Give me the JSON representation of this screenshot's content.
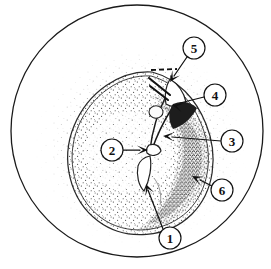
{
  "figure": {
    "kind": "stippled anatomical line drawing",
    "field_shape": "circle",
    "background_color": "#ffffff",
    "ink_color": "#111111",
    "labels": [
      {
        "id": "label-1",
        "text": "1",
        "circle": {
          "cx": 170,
          "cy": 238,
          "r": 11
        },
        "leader": {
          "x1": 163,
          "y1": 229,
          "x2": 148,
          "y2": 190
        },
        "arrow_tip": {
          "x": 146,
          "y": 184
        },
        "arrow_angle_deg": 249
      },
      {
        "id": "label-2",
        "text": "2",
        "circle": {
          "cx": 112,
          "cy": 150,
          "r": 11
        },
        "leader": {
          "x1": 123,
          "y1": 150,
          "x2": 140,
          "y2": 150
        },
        "arrow_tip": {
          "x": 148,
          "y": 150
        },
        "arrow_angle_deg": 0
      },
      {
        "id": "label-3",
        "text": "3",
        "circle": {
          "cx": 232,
          "cy": 141,
          "r": 11
        },
        "leader": {
          "x1": 221,
          "y1": 141,
          "x2": 172,
          "y2": 137
        },
        "arrow_tip": {
          "x": 163,
          "y": 136
        },
        "arrow_angle_deg": 184
      },
      {
        "id": "label-4",
        "text": "4",
        "circle": {
          "cx": 215,
          "cy": 95,
          "r": 11
        },
        "leader": {
          "x1": 204,
          "y1": 97,
          "x2": 180,
          "y2": 103
        },
        "arrow_tip": {
          "x": 172,
          "y": 105
        },
        "arrow_angle_deg": 194
      },
      {
        "id": "label-5",
        "text": "5",
        "circle": {
          "cx": 194,
          "cy": 48,
          "r": 11
        },
        "leader": {
          "x1": 187,
          "y1": 57,
          "x2": 174,
          "y2": 76
        },
        "arrow_tip": {
          "x": 170,
          "y": 82
        },
        "arrow_angle_deg": 124
      },
      {
        "id": "label-6",
        "text": "6",
        "circle": {
          "cx": 222,
          "cy": 190,
          "r": 11
        },
        "leader": {
          "x1": 212,
          "y1": 186,
          "x2": 200,
          "y2": 180
        },
        "arrow_tip": {
          "x": 192,
          "y": 176
        },
        "arrow_angle_deg": 206
      }
    ]
  }
}
